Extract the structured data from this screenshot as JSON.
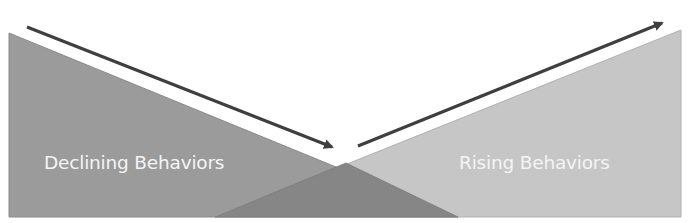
{
  "diagram": {
    "left_label": "Declining Behaviors",
    "right_label": "Rising Behaviors",
    "left_arrow": "declining-trend",
    "right_arrow": "rising-trend"
  },
  "colors": {
    "declining_fill": "#9b9b9b",
    "rising_fill": "#c6c6c6",
    "overlap_fill": "#868686",
    "arrow": "#3f3f3f",
    "label_text": "#f4f4f4",
    "background": "#ffffff"
  }
}
